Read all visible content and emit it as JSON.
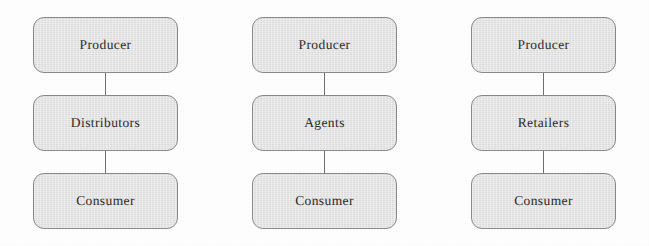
{
  "diagram": {
    "background_color": "#ffffff",
    "node_fill": "#e2e2e2",
    "node_border": "#8a8a8a",
    "connector_color": "#6f6f6f",
    "text_color": "#2b2b2b",
    "channels": [
      {
        "id": "channel-distributors",
        "nodes": [
          {
            "label": "Producer"
          },
          {
            "label": "Distributors"
          },
          {
            "label": "Consumer"
          }
        ]
      },
      {
        "id": "channel-agents",
        "nodes": [
          {
            "label": "Producer"
          },
          {
            "label": "Agents"
          },
          {
            "label": "Consumer"
          }
        ]
      },
      {
        "id": "channel-retailers",
        "nodes": [
          {
            "label": "Producer"
          },
          {
            "label": "Retailers"
          },
          {
            "label": "Consumer"
          }
        ]
      }
    ]
  }
}
